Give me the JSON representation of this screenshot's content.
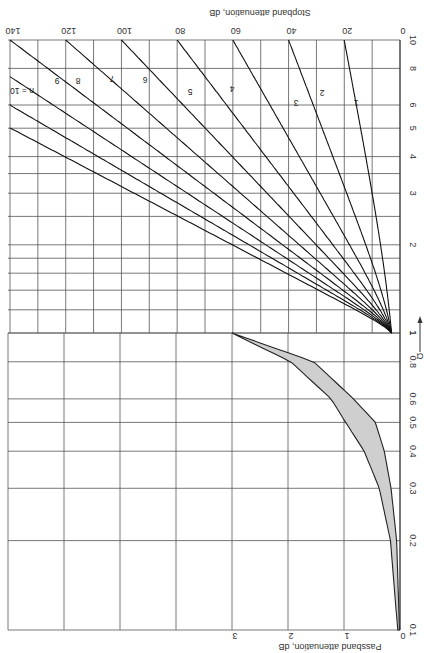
{
  "chart_data": {
    "type": "line",
    "title": "",
    "orientation": "rotated 90 degrees clockwise (frequency axis runs vertically, attenuation horizontally, increasing to the left)",
    "xlabel": "Ω",
    "x_axis_arrow": "→",
    "stopband": {
      "ylabel": "Stopband attenuation, dB",
      "x_range": [
        1,
        10
      ],
      "x_scale": "log",
      "x_ticks": [
        "1",
        "2",
        "3",
        "4",
        "5",
        "6",
        "8",
        "10"
      ],
      "x_gridlines": [
        1,
        1.2,
        1.4,
        1.6,
        1.8,
        2,
        2.5,
        3,
        3.5,
        4,
        5,
        6,
        8,
        10
      ],
      "y_range": [
        0,
        140
      ],
      "y_ticks": [
        "0",
        "20",
        "40",
        "60",
        "80",
        "100",
        "120",
        "140"
      ],
      "y_gridlines": [
        0,
        10,
        20,
        30,
        40,
        50,
        60,
        70,
        80,
        90,
        100,
        110,
        120,
        130,
        140
      ],
      "series": [
        {
          "name": "1",
          "n": 1,
          "points": [
            [
              1,
              3.0
            ],
            [
              2,
              7.0
            ],
            [
              3,
              10.0
            ],
            [
              5,
              14.1
            ],
            [
              10,
              20.0
            ]
          ]
        },
        {
          "name": "2",
          "n": 2,
          "points": [
            [
              1,
              3.0
            ],
            [
              2,
              12.3
            ],
            [
              3,
              19.1
            ],
            [
              5,
              28.0
            ],
            [
              10,
              40.0
            ]
          ]
        },
        {
          "name": "3",
          "n": 3,
          "points": [
            [
              1,
              3.0
            ],
            [
              2,
              18.1
            ],
            [
              3,
              28.6
            ],
            [
              5,
              41.9
            ],
            [
              10,
              60.0
            ]
          ]
        },
        {
          "name": "4",
          "n": 4,
          "points": [
            [
              1,
              3.0
            ],
            [
              2,
              24.1
            ],
            [
              3,
              38.2
            ],
            [
              5,
              55.9
            ],
            [
              10,
              80.0
            ]
          ]
        },
        {
          "name": "5",
          "n": 5,
          "points": [
            [
              1,
              3.0
            ],
            [
              2,
              30.1
            ],
            [
              3,
              47.7
            ],
            [
              5,
              69.9
            ],
            [
              10,
              100.0
            ]
          ]
        },
        {
          "name": "6",
          "n": 6,
          "points": [
            [
              1,
              3.0
            ],
            [
              2,
              36.1
            ],
            [
              3,
              57.3
            ],
            [
              5,
              83.9
            ],
            [
              10,
              120.0
            ]
          ]
        },
        {
          "name": "7",
          "n": 7,
          "points": [
            [
              1,
              3.0
            ],
            [
              2,
              42.1
            ],
            [
              3,
              66.8
            ],
            [
              5,
              97.9
            ],
            [
              10,
              140.0
            ]
          ]
        },
        {
          "name": "8",
          "n": 8,
          "points": [
            [
              1,
              3.0
            ],
            [
              2,
              48.2
            ],
            [
              3,
              76.3
            ],
            [
              5,
              111.8
            ],
            [
              10,
              160.0
            ]
          ]
        },
        {
          "name": "9",
          "n": 9,
          "points": [
            [
              1,
              3.0
            ],
            [
              2,
              54.2
            ],
            [
              3,
              85.9
            ],
            [
              5,
              125.8
            ],
            [
              10,
              180.0
            ]
          ]
        },
        {
          "name": "n = 10",
          "n": 10,
          "points": [
            [
              1,
              3.0
            ],
            [
              2,
              60.2
            ],
            [
              3,
              95.4
            ],
            [
              5,
              139.8
            ],
            [
              10,
              200.0
            ]
          ]
        }
      ]
    },
    "passband": {
      "ylabel": "Passband attenuation, dB",
      "x_range": [
        0.1,
        1
      ],
      "x_scale": "log",
      "x_ticks": [
        "0.1",
        "0.2",
        "0.3",
        "0.4",
        "0.5",
        "0.6",
        "0.8",
        "1"
      ],
      "x_gridlines": [
        0.1,
        0.2,
        0.3,
        0.4,
        0.5,
        0.6,
        0.8,
        1
      ],
      "y_range": [
        0,
        3
      ],
      "y_ticks": [
        "0",
        "1",
        "2",
        "3"
      ],
      "y_gridlines": [
        0,
        1,
        2,
        3,
        4,
        5,
        6,
        7
      ],
      "shaded_band": {
        "upper_bound": [
          [
            0.1,
            0.04
          ],
          [
            0.2,
            0.17
          ],
          [
            0.3,
            0.37
          ],
          [
            0.4,
            0.64
          ],
          [
            0.5,
            0.97
          ],
          [
            0.6,
            1.23
          ],
          [
            0.8,
            1.95
          ],
          [
            1,
            3.0
          ]
        ],
        "lower_bound": [
          [
            0.1,
            0.01
          ],
          [
            0.2,
            0.06
          ],
          [
            0.3,
            0.16
          ],
          [
            0.4,
            0.28
          ],
          [
            0.5,
            0.44
          ],
          [
            0.6,
            0.83
          ],
          [
            0.8,
            1.54
          ],
          [
            1,
            3.0
          ]
        ]
      }
    },
    "grid": true,
    "legend": "inline labels n = 1 … 10 on curves"
  },
  "labels": {
    "stopband_title": "Stopband attenuation, dB",
    "passband_title": "Passband attenuation, dB",
    "omega": "Ω",
    "arrow": "⟶"
  }
}
